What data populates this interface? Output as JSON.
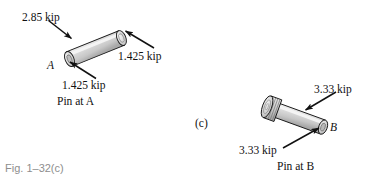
{
  "figure": {
    "caption": "Fig. 1–32(c)",
    "panel_tag": "(c)",
    "background_color": "#ffffff",
    "ink_color": "#111111",
    "caption_color": "#8e8e8e",
    "body_fill": "#d9d9d9",
    "body_fill_light": "#f0f0f0",
    "body_fill_dark": "#b3b3b3"
  },
  "pin_a": {
    "title": "Pin at A",
    "point_label": "A",
    "load_top": "2.85 kip",
    "load_right": "1.425 kip",
    "load_bottom": "1.425 kip"
  },
  "pin_b": {
    "title": "Pin at B",
    "point_label": "B",
    "load_top": "3.33 kip",
    "load_bottom": "3.33 kip"
  }
}
